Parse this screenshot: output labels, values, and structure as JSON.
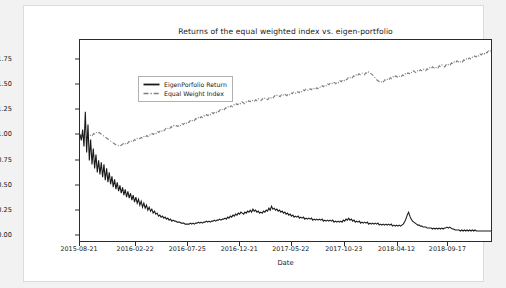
{
  "figure": {
    "title": "Returns of the equal weighted index vs. eigen-portfolio"
  },
  "chart_data": {
    "type": "line",
    "title": "Returns of the equal weighted index vs. eigen-portfolio",
    "xlabel": "Date",
    "ylabel": "",
    "grid": false,
    "legend_position": "upper left",
    "ylim": [
      -0.07,
      1.95
    ],
    "yticks": [
      "0.00",
      "0.25",
      "0.50",
      "0.75",
      "1.00",
      "1.25",
      "1.50",
      "1.75"
    ],
    "ytick_values": [
      0.0,
      0.25,
      0.5,
      0.75,
      1.0,
      1.25,
      1.5,
      1.75
    ],
    "xticks": [
      "2015-08-21",
      "2016-02-22",
      "2016-07-25",
      "2016-12-21",
      "2017-05-22",
      "2017-10-23",
      "2018-04-12",
      "2018-09-17"
    ],
    "xtick_positions": [
      0,
      0.136,
      0.262,
      0.388,
      0.513,
      0.641,
      0.769,
      0.892
    ],
    "colors": {
      "eigen_portfolio": "#1a1a1a",
      "equal_weight": "#7d7d7d"
    },
    "series": [
      {
        "name": "EigenPorfolio Return",
        "style": "solid",
        "color": "#1a1a1a",
        "values": [
          1.0,
          0.94,
          1.05,
          0.88,
          1.23,
          0.82,
          1.1,
          0.74,
          0.95,
          0.7,
          0.86,
          0.66,
          0.8,
          0.62,
          0.74,
          0.6,
          0.72,
          0.57,
          0.7,
          0.54,
          0.66,
          0.52,
          0.62,
          0.5,
          0.58,
          0.47,
          0.55,
          0.45,
          0.52,
          0.43,
          0.49,
          0.41,
          0.47,
          0.39,
          0.45,
          0.37,
          0.43,
          0.36,
          0.41,
          0.34,
          0.39,
          0.32,
          0.37,
          0.31,
          0.35,
          0.29,
          0.33,
          0.27,
          0.31,
          0.26,
          0.29,
          0.24,
          0.27,
          0.23,
          0.25,
          0.21,
          0.23,
          0.2,
          0.21,
          0.18,
          0.19,
          0.17,
          0.18,
          0.16,
          0.17,
          0.15,
          0.16,
          0.14,
          0.15,
          0.13,
          0.14,
          0.13,
          0.13,
          0.12,
          0.12,
          0.12,
          0.11,
          0.11,
          0.11,
          0.1,
          0.1,
          0.1,
          0.1,
          0.11,
          0.1,
          0.11,
          0.1,
          0.11,
          0.11,
          0.12,
          0.11,
          0.12,
          0.11,
          0.12,
          0.12,
          0.13,
          0.12,
          0.13,
          0.12,
          0.13,
          0.13,
          0.14,
          0.13,
          0.14,
          0.14,
          0.15,
          0.14,
          0.15,
          0.15,
          0.16,
          0.15,
          0.17,
          0.16,
          0.18,
          0.17,
          0.19,
          0.18,
          0.2,
          0.19,
          0.21,
          0.2,
          0.22,
          0.21,
          0.2,
          0.22,
          0.21,
          0.23,
          0.22,
          0.24,
          0.22,
          0.25,
          0.23,
          0.24,
          0.22,
          0.23,
          0.21,
          0.22,
          0.21,
          0.23,
          0.22,
          0.24,
          0.23,
          0.26,
          0.24,
          0.28,
          0.25,
          0.26,
          0.24,
          0.25,
          0.23,
          0.24,
          0.22,
          0.23,
          0.21,
          0.22,
          0.2,
          0.21,
          0.19,
          0.2,
          0.18,
          0.19,
          0.17,
          0.18,
          0.17,
          0.18,
          0.16,
          0.17,
          0.16,
          0.17,
          0.15,
          0.16,
          0.15,
          0.16,
          0.15,
          0.16,
          0.14,
          0.15,
          0.14,
          0.15,
          0.14,
          0.15,
          0.14,
          0.15,
          0.13,
          0.14,
          0.13,
          0.14,
          0.13,
          0.14,
          0.13,
          0.14,
          0.12,
          0.13,
          0.12,
          0.13,
          0.12,
          0.13,
          0.12,
          0.14,
          0.13,
          0.15,
          0.14,
          0.16,
          0.14,
          0.15,
          0.13,
          0.14,
          0.12,
          0.13,
          0.12,
          0.13,
          0.11,
          0.12,
          0.11,
          0.12,
          0.11,
          0.12,
          0.1,
          0.11,
          0.1,
          0.11,
          0.1,
          0.11,
          0.1,
          0.11,
          0.09,
          0.1,
          0.09,
          0.1,
          0.09,
          0.1,
          0.09,
          0.1,
          0.09,
          0.1,
          0.08,
          0.09,
          0.08,
          0.09,
          0.08,
          0.09,
          0.08,
          0.09,
          0.1,
          0.12,
          0.15,
          0.19,
          0.22,
          0.18,
          0.15,
          0.13,
          0.12,
          0.11,
          0.1,
          0.09,
          0.09,
          0.08,
          0.08,
          0.07,
          0.07,
          0.07,
          0.06,
          0.06,
          0.06,
          0.06,
          0.05,
          0.06,
          0.05,
          0.06,
          0.05,
          0.06,
          0.05,
          0.06,
          0.05,
          0.06,
          0.06,
          0.07,
          0.06,
          0.07,
          0.06,
          0.05,
          0.05,
          0.04,
          0.04,
          0.04,
          0.04,
          0.03,
          0.04,
          0.03,
          0.04,
          0.03,
          0.04,
          0.03,
          0.04,
          0.03,
          0.04,
          0.03,
          0.04,
          0.03,
          0.03,
          0.03,
          0.03,
          0.03,
          0.03,
          0.03,
          0.03,
          0.03,
          0.03,
          0.03,
          0.03
        ]
      },
      {
        "name": "Equal Weight Index",
        "style": "dashdot",
        "color": "#7d7d7d",
        "values": [
          1.0,
          0.99,
          0.97,
          0.96,
          0.98,
          0.97,
          0.99,
          0.98,
          1.0,
          0.99,
          1.01,
          1.0,
          1.02,
          1.01,
          1.02,
          1.01,
          1.0,
          0.99,
          0.98,
          0.97,
          0.96,
          0.95,
          0.94,
          0.93,
          0.92,
          0.91,
          0.9,
          0.89,
          0.89,
          0.88,
          0.89,
          0.9,
          0.91,
          0.9,
          0.92,
          0.91,
          0.93,
          0.92,
          0.94,
          0.93,
          0.95,
          0.94,
          0.96,
          0.95,
          0.96,
          0.97,
          0.96,
          0.98,
          0.97,
          0.99,
          0.98,
          1.0,
          0.99,
          1.01,
          1.0,
          1.02,
          1.01,
          1.03,
          1.02,
          1.04,
          1.03,
          1.05,
          1.04,
          1.06,
          1.05,
          1.07,
          1.06,
          1.08,
          1.07,
          1.09,
          1.08,
          1.09,
          1.08,
          1.1,
          1.09,
          1.11,
          1.1,
          1.12,
          1.11,
          1.13,
          1.12,
          1.14,
          1.13,
          1.15,
          1.14,
          1.16,
          1.15,
          1.17,
          1.16,
          1.18,
          1.17,
          1.19,
          1.18,
          1.2,
          1.19,
          1.21,
          1.2,
          1.22,
          1.21,
          1.23,
          1.22,
          1.24,
          1.23,
          1.25,
          1.24,
          1.26,
          1.25,
          1.27,
          1.26,
          1.28,
          1.27,
          1.29,
          1.28,
          1.3,
          1.29,
          1.31,
          1.3,
          1.32,
          1.31,
          1.33,
          1.32,
          1.31,
          1.33,
          1.32,
          1.34,
          1.33,
          1.35,
          1.34,
          1.33,
          1.35,
          1.34,
          1.36,
          1.35,
          1.34,
          1.36,
          1.35,
          1.37,
          1.36,
          1.35,
          1.37,
          1.36,
          1.38,
          1.37,
          1.39,
          1.38,
          1.4,
          1.39,
          1.38,
          1.4,
          1.39,
          1.41,
          1.4,
          1.39,
          1.41,
          1.4,
          1.42,
          1.41,
          1.43,
          1.42,
          1.41,
          1.43,
          1.42,
          1.44,
          1.43,
          1.45,
          1.44,
          1.46,
          1.45,
          1.44,
          1.46,
          1.45,
          1.47,
          1.46,
          1.45,
          1.47,
          1.46,
          1.48,
          1.47,
          1.49,
          1.48,
          1.5,
          1.49,
          1.51,
          1.5,
          1.52,
          1.51,
          1.53,
          1.52,
          1.51,
          1.53,
          1.52,
          1.54,
          1.53,
          1.55,
          1.54,
          1.56,
          1.55,
          1.57,
          1.56,
          1.58,
          1.57,
          1.59,
          1.58,
          1.6,
          1.59,
          1.61,
          1.6,
          1.62,
          1.61,
          1.6,
          1.62,
          1.61,
          1.63,
          1.62,
          1.61,
          1.6,
          1.58,
          1.57,
          1.55,
          1.54,
          1.53,
          1.52,
          1.54,
          1.53,
          1.55,
          1.54,
          1.56,
          1.55,
          1.57,
          1.56,
          1.58,
          1.57,
          1.59,
          1.58,
          1.57,
          1.59,
          1.58,
          1.6,
          1.59,
          1.61,
          1.6,
          1.62,
          1.61,
          1.63,
          1.62,
          1.64,
          1.63,
          1.62,
          1.64,
          1.63,
          1.65,
          1.64,
          1.66,
          1.65,
          1.64,
          1.66,
          1.65,
          1.67,
          1.66,
          1.68,
          1.67,
          1.66,
          1.68,
          1.67,
          1.69,
          1.68,
          1.7,
          1.69,
          1.68,
          1.7,
          1.69,
          1.71,
          1.7,
          1.72,
          1.71,
          1.73,
          1.72,
          1.74,
          1.73,
          1.72,
          1.74,
          1.73,
          1.75,
          1.74,
          1.76,
          1.75,
          1.77,
          1.76,
          1.78,
          1.77,
          1.79,
          1.78,
          1.8,
          1.79,
          1.81,
          1.8,
          1.82,
          1.81,
          1.83,
          1.82,
          1.84,
          1.83,
          1.85
        ]
      }
    ]
  },
  "legend": {
    "entries": [
      {
        "label": "EigenPorfolio Return"
      },
      {
        "label": "Equal Weight Index"
      }
    ]
  },
  "axis": {
    "x_label": "Date"
  }
}
